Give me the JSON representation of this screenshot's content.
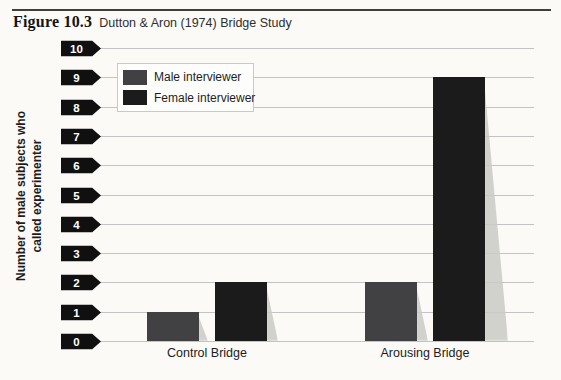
{
  "figure": {
    "label": "Figure 10.3",
    "title": "Dutton & Aron (1974) Bridge Study"
  },
  "chart_data": {
    "type": "bar",
    "categories": [
      "Control Bridge",
      "Arousing Bridge"
    ],
    "series": [
      {
        "name": "Male interviewer",
        "values": [
          1,
          2
        ],
        "color": "#414143"
      },
      {
        "name": "Female interviewer",
        "values": [
          2,
          9
        ],
        "color": "#1b1b1b"
      }
    ],
    "ylabel": "Number of male subjects who called experimenter",
    "ylabel_lines": [
      "Number of male subjects who",
      "called experimenter"
    ],
    "ylim": [
      0,
      10
    ],
    "yticks": [
      0,
      1,
      2,
      3,
      4,
      5,
      6,
      7,
      8,
      9,
      10
    ],
    "grid": "horizontal",
    "legend_position": "top-left",
    "colors": {
      "tick_tag_bg": "#101010",
      "tick_tag_text": "#ffffff",
      "gridline": "#c3c3c3",
      "background": "#fbfaf7",
      "rule": "#3f3f3f"
    }
  }
}
